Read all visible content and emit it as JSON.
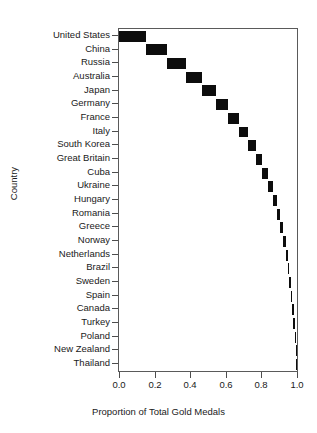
{
  "chart_data": {
    "type": "bar",
    "title": "",
    "subtitle": "",
    "xlabel": "Proportion of Total Gold Medals",
    "ylabel": "Country",
    "orientation": "horizontal",
    "grid": false,
    "legend": null,
    "xlim": [
      0.0,
      1.0
    ],
    "xticks": [
      "0.0",
      "0.2",
      "0.4",
      "0.6",
      "0.8",
      "1.0"
    ],
    "xtick_values": [
      0.0,
      0.2,
      0.4,
      0.6,
      0.8,
      1.0
    ],
    "categories": [
      "United States",
      "China",
      "Russia",
      "Australia",
      "Japan",
      "Germany",
      "France",
      "Italy",
      "South Korea",
      "Great Britain",
      "Cuba",
      "Ukraine",
      "Hungary",
      "Romania",
      "Greece",
      "Norway",
      "Netherlands",
      "Brazil",
      "Sweden",
      "Spain",
      "Canada",
      "Turkey",
      "Poland",
      "New Zealand",
      "Thailand"
    ],
    "cumulative_start": [
      0.0,
      0.15,
      0.272,
      0.378,
      0.466,
      0.544,
      0.611,
      0.672,
      0.722,
      0.767,
      0.806,
      0.839,
      0.867,
      0.889,
      0.906,
      0.922,
      0.936,
      0.947,
      0.956,
      0.964,
      0.972,
      0.979,
      0.986,
      0.992,
      0.996
    ],
    "cumulative_end": [
      0.15,
      0.272,
      0.378,
      0.466,
      0.544,
      0.611,
      0.672,
      0.722,
      0.767,
      0.806,
      0.839,
      0.867,
      0.889,
      0.906,
      0.922,
      0.936,
      0.947,
      0.956,
      0.964,
      0.972,
      0.979,
      0.986,
      0.992,
      0.996,
      1.0
    ],
    "values": [
      0.15,
      0.122,
      0.106,
      0.088,
      0.078,
      0.067,
      0.061,
      0.05,
      0.045,
      0.039,
      0.033,
      0.028,
      0.022,
      0.017,
      0.016,
      0.014,
      0.011,
      0.009,
      0.008,
      0.008,
      0.007,
      0.007,
      0.006,
      0.004,
      0.004
    ],
    "bar_color": "#0d0d0d",
    "frame_color": "#5a5a5a"
  }
}
